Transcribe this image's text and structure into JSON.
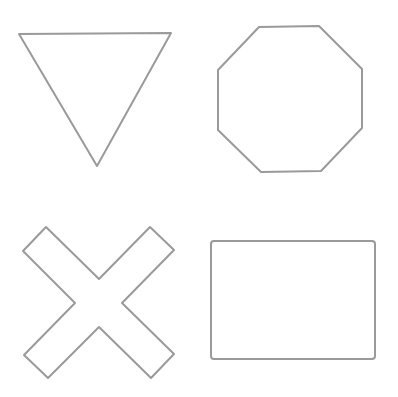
{
  "canvas": {
    "width": 398,
    "height": 397,
    "background": "#ffffff"
  },
  "style": {
    "stroke": "#9a9a9a",
    "stroke_width": 2
  },
  "shapes": [
    {
      "name": "triangle-down",
      "type": "polygon",
      "points": "19,34 171,33 97,166"
    },
    {
      "name": "octagon",
      "type": "polygon",
      "points": "259,27 319,26 362,69 362,128 321,171 261,172 218,130 218,70"
    },
    {
      "name": "x-cross",
      "type": "polygon",
      "points": "46,227 99,279 150,227 174,250 122,303 174,354 151,378 99,327 48,378 24,355 75,303 23,251"
    },
    {
      "name": "rectangle",
      "type": "rect",
      "x": 211,
      "y": 241,
      "width": 164,
      "height": 118,
      "rx": 3
    }
  ]
}
